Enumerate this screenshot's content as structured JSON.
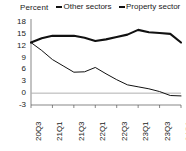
{
  "chart_data": {
    "type": "line",
    "title": "",
    "subtitle": "",
    "ylabel": "Percent",
    "xlabel": "",
    "grid": false,
    "legend_position": "top",
    "ylim": [
      -3,
      18
    ],
    "yticks": [
      "18",
      "15",
      "12",
      "9",
      "6",
      "3",
      "0",
      "-3"
    ],
    "ytick_values": [
      18,
      15,
      12,
      9,
      6,
      3,
      0,
      -3
    ],
    "categories": [
      "20Q3",
      "20Q4",
      "21Q1",
      "21Q2",
      "21Q3",
      "21Q4",
      "22Q1",
      "22Q2",
      "22Q3",
      "22Q4",
      "23Q1",
      "23Q2",
      "23Q3",
      "23Q4",
      "24Q1"
    ],
    "xtick_labels": [
      "20Q3",
      "21Q1",
      "21Q3",
      "22Q1",
      "22Q3",
      "23Q1",
      "23Q3",
      "24Q1"
    ],
    "xtick_indices": [
      0,
      2,
      4,
      6,
      8,
      10,
      12,
      14
    ],
    "series": [
      {
        "name": "Other sectors",
        "color": "#111111",
        "width": "thick",
        "values": [
          12.8,
          13.9,
          14.5,
          14.5,
          14.5,
          14.0,
          13.2,
          13.6,
          14.2,
          14.8,
          16.0,
          15.4,
          15.2,
          15.0,
          12.8
        ]
      },
      {
        "name": "Property sector",
        "color": "#111111",
        "width": "thin",
        "values": [
          12.8,
          10.8,
          8.5,
          6.9,
          5.3,
          5.4,
          6.5,
          4.9,
          3.4,
          2.1,
          1.6,
          1.1,
          0.4,
          -0.6,
          -0.7
        ]
      }
    ],
    "zero_line": 0,
    "zero_line_color": "#b0b0b0"
  },
  "legend": {
    "entries": [
      {
        "label": "Other sectors"
      },
      {
        "label": "Property sector"
      }
    ]
  },
  "axis": {
    "y_title": "Percent"
  }
}
